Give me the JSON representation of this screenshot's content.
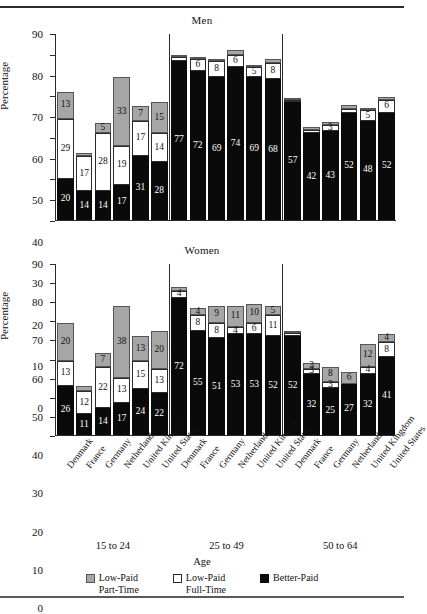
{
  "figure": {
    "ylabel": "Percentage",
    "xlabel": "Age",
    "panels": [
      {
        "title": "Men"
      },
      {
        "title": "Women"
      }
    ],
    "age_groups": [
      "15 to 24",
      "25 to 49",
      "50 to 64"
    ],
    "countries": [
      "Denmark",
      "France",
      "Germany",
      "Netherlands",
      "United Kingdom",
      "United States"
    ],
    "yticks": [
      "0",
      "10",
      "20",
      "30",
      "40",
      "50",
      "60",
      "70",
      "80",
      "90"
    ],
    "legend": [
      {
        "key": "gray",
        "line1": "Low-Paid",
        "line2": "Part-Time",
        "color": "#a6a6a6"
      },
      {
        "key": "white",
        "line1": "Low-Paid",
        "line2": "Full-Time",
        "color": "#ffffff"
      },
      {
        "key": "black",
        "line1": "Better-Paid",
        "line2": "",
        "color": "#0a0a0a"
      }
    ]
  },
  "chart_data": {
    "type": "bar",
    "subtitle": "",
    "xlabel": "Age",
    "ylabel": "Percentage",
    "ylim": [
      0,
      90
    ],
    "ytick_step": 10,
    "grid": false,
    "legend_position": "bottom",
    "stacked": true,
    "stack_order_bottom_to_top": [
      "Better-Paid",
      "Low-Paid Full-Time",
      "Low-Paid Part-Time"
    ],
    "series": [
      {
        "name": "Better-Paid",
        "color": "#0a0a0a"
      },
      {
        "name": "Low-Paid Full-Time",
        "color": "#ffffff"
      },
      {
        "name": "Low-Paid Part-Time",
        "color": "#a6a6a6"
      }
    ],
    "panels": [
      {
        "title": "Men",
        "groups": [
          {
            "age": "15 to 24",
            "bars": [
              {
                "country": "Denmark",
                "better_paid": 20,
                "low_paid_full_time": 29,
                "low_paid_part_time": 13,
                "labels": {
                  "better_paid": "20",
                  "low_paid_full_time": "29",
                  "low_paid_part_time": "13"
                },
                "total": 62
              },
              {
                "country": "France",
                "better_paid": 14,
                "low_paid_full_time": 17,
                "low_paid_part_time": 1.5,
                "labels": {
                  "better_paid": "14",
                  "low_paid_full_time": "17",
                  "low_paid_part_time": ""
                },
                "total": 32.5
              },
              {
                "country": "Germany",
                "better_paid": 14,
                "low_paid_full_time": 28,
                "low_paid_part_time": 5,
                "labels": {
                  "better_paid": "14",
                  "low_paid_full_time": "28",
                  "low_paid_part_time": "5"
                },
                "total": 47
              },
              {
                "country": "Netherlands",
                "better_paid": 17,
                "low_paid_full_time": 19,
                "low_paid_part_time": 33,
                "labels": {
                  "better_paid": "17",
                  "low_paid_full_time": "19",
                  "low_paid_part_time": "33"
                },
                "total": 69
              },
              {
                "country": "United Kingdom",
                "better_paid": 31,
                "low_paid_full_time": 17,
                "low_paid_part_time": 7,
                "labels": {
                  "better_paid": "31",
                  "low_paid_full_time": "17",
                  "low_paid_part_time": "7"
                },
                "total": 55
              },
              {
                "country": "United States",
                "better_paid": 28,
                "low_paid_full_time": 14,
                "low_paid_part_time": 15,
                "labels": {
                  "better_paid": "28",
                  "low_paid_full_time": "14",
                  "low_paid_part_time": "15"
                },
                "total": 57
              }
            ]
          },
          {
            "age": "25 to 49",
            "bars": [
              {
                "country": "Denmark",
                "better_paid": 77,
                "low_paid_full_time": 2,
                "low_paid_part_time": 1,
                "labels": {
                  "better_paid": "77",
                  "low_paid_full_time": "",
                  "low_paid_part_time": ""
                },
                "total": 80
              },
              {
                "country": "France",
                "better_paid": 72,
                "low_paid_full_time": 6,
                "low_paid_part_time": 1,
                "labels": {
                  "better_paid": "72",
                  "low_paid_full_time": "6",
                  "low_paid_part_time": ""
                },
                "total": 79
              },
              {
                "country": "Germany",
                "better_paid": 69,
                "low_paid_full_time": 8,
                "low_paid_part_time": 1,
                "labels": {
                  "better_paid": "69",
                  "low_paid_full_time": "8",
                  "low_paid_part_time": ""
                },
                "total": 78
              },
              {
                "country": "Netherlands",
                "better_paid": 74,
                "low_paid_full_time": 6,
                "low_paid_part_time": 2.5,
                "labels": {
                  "better_paid": "74",
                  "low_paid_full_time": "6",
                  "low_paid_part_time": ""
                },
                "total": 82.5
              },
              {
                "country": "United Kingdom",
                "better_paid": 69,
                "low_paid_full_time": 5,
                "low_paid_part_time": 1,
                "labels": {
                  "better_paid": "69",
                  "low_paid_full_time": "5",
                  "low_paid_part_time": ""
                },
                "total": 75
              },
              {
                "country": "United States",
                "better_paid": 68,
                "low_paid_full_time": 8,
                "low_paid_part_time": 2,
                "labels": {
                  "better_paid": "68",
                  "low_paid_full_time": "8",
                  "low_paid_part_time": ""
                },
                "total": 78
              }
            ]
          },
          {
            "age": "50 to 64",
            "bars": [
              {
                "country": "Denmark",
                "better_paid": 57,
                "low_paid_full_time": 1,
                "low_paid_part_time": 1,
                "labels": {
                  "better_paid": "57",
                  "low_paid_full_time": "",
                  "low_paid_part_time": ""
                },
                "total": 59
              },
              {
                "country": "France",
                "better_paid": 42,
                "low_paid_full_time": 1.5,
                "low_paid_part_time": 1.5,
                "labels": {
                  "better_paid": "42",
                  "low_paid_full_time": "",
                  "low_paid_part_time": ""
                },
                "total": 45
              },
              {
                "country": "Germany",
                "better_paid": 43,
                "low_paid_full_time": 3,
                "low_paid_part_time": 1.5,
                "labels": {
                  "better_paid": "43",
                  "low_paid_full_time": "3",
                  "low_paid_part_time": ""
                },
                "total": 47.5
              },
              {
                "country": "Netherlands",
                "better_paid": 52,
                "low_paid_full_time": 1.5,
                "low_paid_part_time": 2,
                "labels": {
                  "better_paid": "52",
                  "low_paid_full_time": "",
                  "low_paid_part_time": ""
                },
                "total": 55.5
              },
              {
                "country": "United Kingdom",
                "better_paid": 48,
                "low_paid_full_time": 5,
                "low_paid_part_time": 1,
                "labels": {
                  "better_paid": "48",
                  "low_paid_full_time": "5",
                  "low_paid_part_time": ""
                },
                "total": 54
              },
              {
                "country": "United States",
                "better_paid": 52,
                "low_paid_full_time": 6,
                "low_paid_part_time": 1.5,
                "labels": {
                  "better_paid": "52",
                  "low_paid_full_time": "6",
                  "low_paid_part_time": ""
                },
                "total": 59.5
              }
            ]
          }
        ]
      },
      {
        "title": "Women",
        "groups": [
          {
            "age": "15 to 24",
            "bars": [
              {
                "country": "Denmark",
                "better_paid": 26,
                "low_paid_full_time": 13,
                "low_paid_part_time": 20,
                "labels": {
                  "better_paid": "26",
                  "low_paid_full_time": "13",
                  "low_paid_part_time": "20"
                },
                "total": 59
              },
              {
                "country": "France",
                "better_paid": 11,
                "low_paid_full_time": 12,
                "low_paid_part_time": 3,
                "labels": {
                  "better_paid": "11",
                  "low_paid_full_time": "12",
                  "low_paid_part_time": ""
                },
                "total": 26
              },
              {
                "country": "Germany",
                "better_paid": 14,
                "low_paid_full_time": 22,
                "low_paid_part_time": 7,
                "labels": {
                  "better_paid": "14",
                  "low_paid_full_time": "22",
                  "low_paid_part_time": "7"
                },
                "total": 43
              },
              {
                "country": "Netherlands",
                "better_paid": 17,
                "low_paid_full_time": 13,
                "low_paid_part_time": 38,
                "labels": {
                  "better_paid": "17",
                  "low_paid_full_time": "13",
                  "low_paid_part_time": "38"
                },
                "total": 68
              },
              {
                "country": "United Kingdom",
                "better_paid": 24,
                "low_paid_full_time": 15,
                "low_paid_part_time": 13,
                "labels": {
                  "better_paid": "24",
                  "low_paid_full_time": "15",
                  "low_paid_part_time": "13"
                },
                "total": 52
              },
              {
                "country": "United States",
                "better_paid": 22,
                "low_paid_full_time": 13,
                "low_paid_part_time": 20,
                "labels": {
                  "better_paid": "22",
                  "low_paid_full_time": "13",
                  "low_paid_part_time": "20"
                },
                "total": 55
              }
            ]
          },
          {
            "age": "25 to 49",
            "bars": [
              {
                "country": "Denmark",
                "better_paid": 72,
                "low_paid_full_time": 4,
                "low_paid_part_time": 2,
                "labels": {
                  "better_paid": "72",
                  "low_paid_full_time": "4",
                  "low_paid_part_time": ""
                },
                "total": 78
              },
              {
                "country": "France",
                "better_paid": 55,
                "low_paid_full_time": 8,
                "low_paid_part_time": 4,
                "labels": {
                  "better_paid": "55",
                  "low_paid_full_time": "8",
                  "low_paid_part_time": "4"
                },
                "total": 67
              },
              {
                "country": "Germany",
                "better_paid": 51,
                "low_paid_full_time": 8,
                "low_paid_part_time": 9,
                "labels": {
                  "better_paid": "51",
                  "low_paid_full_time": "8",
                  "low_paid_part_time": "9"
                },
                "total": 68
              },
              {
                "country": "Netherlands",
                "better_paid": 53,
                "low_paid_full_time": 4,
                "low_paid_part_time": 11,
                "labels": {
                  "better_paid": "53",
                  "low_paid_full_time": "4",
                  "low_paid_part_time": "11"
                },
                "total": 68
              },
              {
                "country": "United Kingdom",
                "better_paid": 53,
                "low_paid_full_time": 6,
                "low_paid_part_time": 10,
                "labels": {
                  "better_paid": "53",
                  "low_paid_full_time": "6",
                  "low_paid_part_time": "10"
                },
                "total": 69
              },
              {
                "country": "United States",
                "better_paid": 52,
                "low_paid_full_time": 11,
                "low_paid_part_time": 5,
                "labels": {
                  "better_paid": "52",
                  "low_paid_full_time": "11",
                  "low_paid_part_time": "5"
                },
                "total": 68
              }
            ]
          },
          {
            "age": "50 to 64",
            "bars": [
              {
                "country": "Denmark",
                "better_paid": 52,
                "low_paid_full_time": 1.5,
                "low_paid_part_time": 1.5,
                "labels": {
                  "better_paid": "52",
                  "low_paid_full_time": "",
                  "low_paid_part_time": ""
                },
                "total": 55
              },
              {
                "country": "France",
                "better_paid": 32,
                "low_paid_full_time": 3,
                "low_paid_part_time": 3,
                "labels": {
                  "better_paid": "32",
                  "low_paid_full_time": "3",
                  "low_paid_part_time": "3"
                },
                "total": 38
              },
              {
                "country": "Germany",
                "better_paid": 25,
                "low_paid_full_time": 3,
                "low_paid_part_time": 8,
                "labels": {
                  "better_paid": "25",
                  "low_paid_full_time": "3",
                  "low_paid_part_time": "8"
                },
                "total": 36
              },
              {
                "country": "Netherlands",
                "better_paid": 27,
                "low_paid_full_time": 0,
                "low_paid_part_time": 6,
                "labels": {
                  "better_paid": "27",
                  "low_paid_full_time": "",
                  "low_paid_part_time": "6"
                },
                "total": 33
              },
              {
                "country": "United Kingdom",
                "better_paid": 32,
                "low_paid_full_time": 4,
                "low_paid_part_time": 12,
                "labels": {
                  "better_paid": "32",
                  "low_paid_full_time": "4",
                  "low_paid_part_time": "12"
                },
                "total": 48
              },
              {
                "country": "United States",
                "better_paid": 41,
                "low_paid_full_time": 8,
                "low_paid_part_time": 4,
                "labels": {
                  "better_paid": "41",
                  "low_paid_full_time": "8",
                  "low_paid_part_time": "4"
                },
                "total": 53
              }
            ]
          }
        ]
      }
    ]
  }
}
